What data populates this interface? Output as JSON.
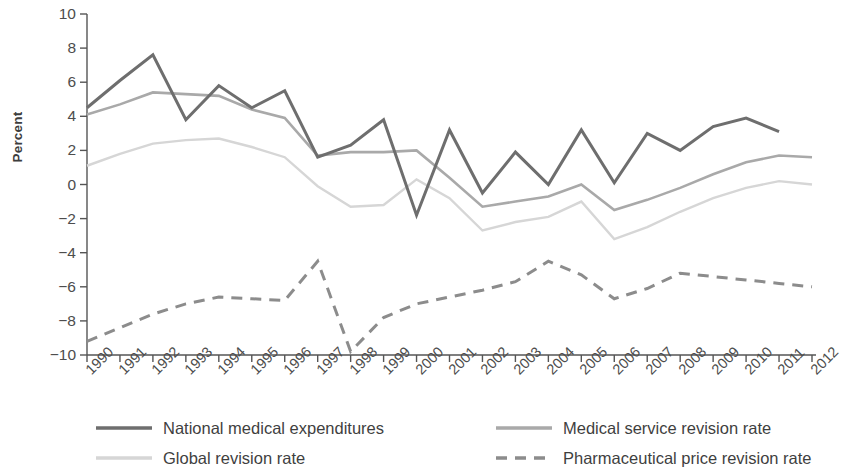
{
  "chart_data": {
    "type": "line",
    "title": "",
    "xlabel": "",
    "ylabel": "Percent",
    "x": [
      1990,
      1991,
      1992,
      1993,
      1994,
      1995,
      1996,
      1997,
      1998,
      1999,
      2000,
      2001,
      2002,
      2003,
      2004,
      2005,
      2006,
      2007,
      2008,
      2009,
      2010,
      2011,
      2012
    ],
    "xtick_labels": [
      "1990",
      "1991",
      "1992",
      "1993",
      "1994",
      "1995",
      "1996",
      "1997",
      "1998",
      "1999",
      "2000",
      "2001",
      "2002",
      "2003",
      "2004",
      "2005",
      "2006",
      "2007",
      "2008",
      "2009",
      "2010",
      "2011",
      "2012"
    ],
    "ytick_labels": [
      "10",
      "8",
      "6",
      "4",
      "2",
      "0",
      "−2",
      "−4",
      "−6",
      "−8",
      "−10"
    ],
    "ytick_values": [
      10,
      8,
      6,
      4,
      2,
      0,
      -2,
      -4,
      -6,
      -8,
      -10
    ],
    "ylim": [
      -10,
      10
    ],
    "xlim": [
      1990,
      2012
    ],
    "grid": false,
    "legend_position": "bottom",
    "series": [
      {
        "name": "National medical expenditures",
        "style": "solid",
        "color": "#6e6e6e",
        "width": 3.0,
        "x": [
          1990,
          1991,
          1992,
          1993,
          1994,
          1995,
          1996,
          1997,
          1998,
          1999,
          2000,
          2001,
          2002,
          2003,
          2004,
          2005,
          2006,
          2007,
          2008,
          2009,
          2010,
          2011
        ],
        "values": [
          4.5,
          6.1,
          7.6,
          3.8,
          5.8,
          4.5,
          5.5,
          1.6,
          2.3,
          3.8,
          -1.8,
          3.2,
          -0.5,
          1.9,
          0.0,
          3.2,
          0.1,
          3.0,
          2.0,
          3.4,
          3.9,
          3.1
        ]
      },
      {
        "name": "Medical service revision rate",
        "style": "solid",
        "color": "#a9a9a9",
        "width": 2.6,
        "x": [
          1990,
          1991,
          1992,
          1993,
          1994,
          1995,
          1996,
          1997,
          1998,
          1999,
          2000,
          2001,
          2002,
          2003,
          2004,
          2005,
          2006,
          2007,
          2008,
          2009,
          2010,
          2011,
          2012
        ],
        "values": [
          4.1,
          4.7,
          5.4,
          5.3,
          5.2,
          4.4,
          3.9,
          1.7,
          1.9,
          1.9,
          2.0,
          0.4,
          -1.3,
          -1.0,
          -0.7,
          0.0,
          -1.5,
          -0.9,
          -0.2,
          0.6,
          1.3,
          1.7,
          1.6
        ]
      },
      {
        "name": "Global revision rate",
        "style": "solid",
        "color": "#d6d6d6",
        "width": 2.4,
        "x": [
          1990,
          1991,
          1992,
          1993,
          1994,
          1995,
          1996,
          1997,
          1998,
          1999,
          2000,
          2001,
          2002,
          2003,
          2004,
          2005,
          2006,
          2007,
          2008,
          2009,
          2010,
          2011,
          2012
        ],
        "values": [
          1.1,
          1.8,
          2.4,
          2.6,
          2.7,
          2.2,
          1.6,
          -0.1,
          -1.3,
          -1.2,
          0.3,
          -0.8,
          -2.7,
          -2.2,
          -1.9,
          -1.0,
          -3.2,
          -2.5,
          -1.6,
          -0.8,
          -0.2,
          0.2,
          0.0
        ]
      },
      {
        "name": "Pharmaceutical price revision rate",
        "style": "dashed",
        "color": "#8c8c8c",
        "width": 3.0,
        "x": [
          1990,
          1991,
          1992,
          1993,
          1994,
          1995,
          1996,
          1997,
          1998,
          1999,
          2000,
          2001,
          2002,
          2003,
          2004,
          2005,
          2006,
          2007,
          2008,
          2009,
          2010,
          2011,
          2012
        ],
        "values": [
          -9.2,
          -8.4,
          -7.6,
          -7.0,
          -6.6,
          -6.7,
          -6.8,
          -4.5,
          -9.8,
          -7.8,
          -7.0,
          -6.6,
          -6.2,
          -5.7,
          -4.5,
          -5.3,
          -6.7,
          -6.1,
          -5.2,
          -5.4,
          -5.6,
          -5.8,
          -6.0
        ]
      }
    ]
  },
  "legend": {
    "items": [
      {
        "label": "National medical expenditures",
        "color": "#6e6e6e",
        "style": "solid"
      },
      {
        "label": "Medical service revision rate",
        "color": "#a9a9a9",
        "style": "solid"
      },
      {
        "label": "Global revision rate",
        "color": "#d6d6d6",
        "style": "solid"
      },
      {
        "label": "Pharmaceutical price revision rate",
        "color": "#8c8c8c",
        "style": "dashed"
      }
    ]
  },
  "axis": {
    "y_title": "Percent"
  }
}
